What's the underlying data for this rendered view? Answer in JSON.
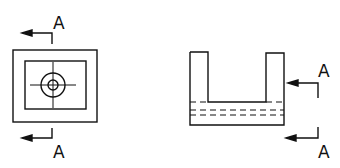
{
  "diagram": {
    "type": "orthographic-drawing",
    "views": [
      {
        "name": "top-view",
        "description": "Square outer boundary with inner rectangle and concentric hole with center lines"
      },
      {
        "name": "front-view",
        "description": "U-shaped part with hidden lines through base"
      }
    ],
    "section_labels": {
      "top_view_top": "A",
      "top_view_bottom": "A",
      "front_view_top": "A",
      "front_view_bottom": "A"
    },
    "colors": {
      "line": "#111111",
      "background": "#ffffff"
    }
  }
}
